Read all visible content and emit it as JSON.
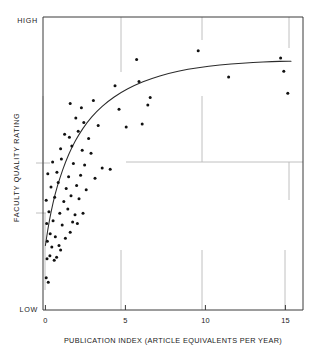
{
  "chart_data": {
    "type": "scatter",
    "title": "",
    "xlabel": "PUBLICATION INDEX (ARTICLE EQUIVALENTS PER YEAR)",
    "ylabel": "FACULTY QUALITY RATING",
    "xlim": [
      -0.15,
      16.1
    ],
    "ylim": [
      0,
      100
    ],
    "grid": false,
    "legend": null,
    "xticks": [
      0,
      5,
      10,
      15
    ],
    "xtick_labels": [
      "0",
      "5",
      "10",
      "15"
    ],
    "ytick_labels_endpoints": {
      "high": "HIGH",
      "low": "LOW"
    },
    "annotations": [],
    "points": [
      {
        "x": 0.05,
        "y": 11.0
      },
      {
        "x": 0.18,
        "y": 9.5
      },
      {
        "x": 0.1,
        "y": 17.5
      },
      {
        "x": 0.28,
        "y": 18.5
      },
      {
        "x": 0.55,
        "y": 17.0
      },
      {
        "x": 0.7,
        "y": 18.0
      },
      {
        "x": 0.12,
        "y": 23.5
      },
      {
        "x": 0.4,
        "y": 21.5
      },
      {
        "x": 0.85,
        "y": 22.0
      },
      {
        "x": 0.95,
        "y": 20.5
      },
      {
        "x": 0.3,
        "y": 26.0
      },
      {
        "x": 0.62,
        "y": 25.0
      },
      {
        "x": 1.25,
        "y": 24.5
      },
      {
        "x": 1.55,
        "y": 26.5
      },
      {
        "x": 0.08,
        "y": 29.5
      },
      {
        "x": 0.48,
        "y": 30.5
      },
      {
        "x": 1.05,
        "y": 29.0
      },
      {
        "x": 1.7,
        "y": 30.0
      },
      {
        "x": 2.0,
        "y": 29.5
      },
      {
        "x": 0.22,
        "y": 33.5
      },
      {
        "x": 0.9,
        "y": 33.0
      },
      {
        "x": 1.4,
        "y": 34.5
      },
      {
        "x": 1.85,
        "y": 32.5
      },
      {
        "x": 2.35,
        "y": 33.0
      },
      {
        "x": 0.05,
        "y": 37.5
      },
      {
        "x": 0.58,
        "y": 38.5
      },
      {
        "x": 1.15,
        "y": 37.0
      },
      {
        "x": 1.6,
        "y": 39.0
      },
      {
        "x": 2.1,
        "y": 38.0
      },
      {
        "x": 0.35,
        "y": 42.0
      },
      {
        "x": 0.8,
        "y": 43.5
      },
      {
        "x": 1.3,
        "y": 41.5
      },
      {
        "x": 1.95,
        "y": 42.5
      },
      {
        "x": 2.55,
        "y": 41.0
      },
      {
        "x": 0.15,
        "y": 46.5
      },
      {
        "x": 0.72,
        "y": 47.0
      },
      {
        "x": 1.45,
        "y": 45.5
      },
      {
        "x": 2.2,
        "y": 46.0
      },
      {
        "x": 3.1,
        "y": 45.0
      },
      {
        "x": 0.45,
        "y": 50.5
      },
      {
        "x": 1.0,
        "y": 51.5
      },
      {
        "x": 1.75,
        "y": 50.0
      },
      {
        "x": 2.45,
        "y": 49.5
      },
      {
        "x": 3.55,
        "y": 48.5
      },
      {
        "x": 4.05,
        "y": 48.0
      },
      {
        "x": 0.95,
        "y": 55.0
      },
      {
        "x": 1.65,
        "y": 56.0
      },
      {
        "x": 2.3,
        "y": 54.5
      },
      {
        "x": 2.85,
        "y": 53.5
      },
      {
        "x": 1.2,
        "y": 60.0
      },
      {
        "x": 1.5,
        "y": 59.0
      },
      {
        "x": 2.05,
        "y": 61.0
      },
      {
        "x": 2.7,
        "y": 58.5
      },
      {
        "x": 1.9,
        "y": 65.5
      },
      {
        "x": 2.4,
        "y": 64.0
      },
      {
        "x": 3.3,
        "y": 63.0
      },
      {
        "x": 5.05,
        "y": 62.5
      },
      {
        "x": 6.05,
        "y": 63.5
      },
      {
        "x": 1.55,
        "y": 70.5
      },
      {
        "x": 2.25,
        "y": 69.0
      },
      {
        "x": 3.0,
        "y": 71.5
      },
      {
        "x": 4.6,
        "y": 68.5
      },
      {
        "x": 6.4,
        "y": 70.0
      },
      {
        "x": 6.55,
        "y": 72.5
      },
      {
        "x": 4.35,
        "y": 76.5
      },
      {
        "x": 5.85,
        "y": 78.0
      },
      {
        "x": 11.45,
        "y": 79.5
      },
      {
        "x": 15.15,
        "y": 74.0
      },
      {
        "x": 5.7,
        "y": 85.5
      },
      {
        "x": 9.55,
        "y": 88.5
      },
      {
        "x": 14.7,
        "y": 86.0
      },
      {
        "x": 14.9,
        "y": 81.5
      }
    ],
    "fit_curve": {
      "kind": "asymptotic-log",
      "description": "rising logarithmic trend flattening to a plateau",
      "points": [
        {
          "x": 0.0,
          "y": 22.0
        },
        {
          "x": 0.15,
          "y": 27.5
        },
        {
          "x": 0.35,
          "y": 33.5
        },
        {
          "x": 0.6,
          "y": 39.5
        },
        {
          "x": 0.9,
          "y": 45.0
        },
        {
          "x": 1.25,
          "y": 50.5
        },
        {
          "x": 1.65,
          "y": 55.5
        },
        {
          "x": 2.1,
          "y": 60.0
        },
        {
          "x": 2.6,
          "y": 64.0
        },
        {
          "x": 3.2,
          "y": 67.8
        },
        {
          "x": 3.9,
          "y": 71.2
        },
        {
          "x": 4.7,
          "y": 74.2
        },
        {
          "x": 5.6,
          "y": 76.8
        },
        {
          "x": 6.6,
          "y": 79.0
        },
        {
          "x": 7.7,
          "y": 80.8
        },
        {
          "x": 8.9,
          "y": 82.2
        },
        {
          "x": 10.2,
          "y": 83.2
        },
        {
          "x": 11.6,
          "y": 84.0
        },
        {
          "x": 13.0,
          "y": 84.5
        },
        {
          "x": 14.2,
          "y": 84.8
        },
        {
          "x": 15.05,
          "y": 84.9
        },
        {
          "x": 15.35,
          "y": 84.9
        }
      ]
    }
  },
  "artifacts": {
    "note": "faint scan/registration marks from the original printed figure",
    "marks": [
      {
        "name": "top-tick-at-5"
      },
      {
        "name": "top-tick-at-10"
      },
      {
        "name": "right-tick-upper"
      },
      {
        "name": "mid-horizontal-rule"
      },
      {
        "name": "left-tick-mid"
      },
      {
        "name": "bottom-tick-at-5"
      },
      {
        "name": "bottom-tick-at-10"
      },
      {
        "name": "bottom-tick-at-15"
      }
    ]
  }
}
